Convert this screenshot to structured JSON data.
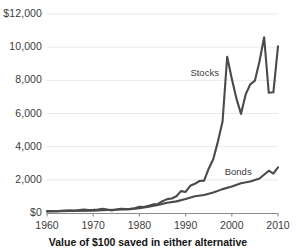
{
  "chart_data": {
    "type": "line",
    "title": "",
    "subtitle": "",
    "caption": "Value of $100 saved in either alternative",
    "xlabel": "",
    "ylabel": "",
    "xlim": [
      1960,
      2010
    ],
    "ylim": [
      0,
      12000
    ],
    "grid": true,
    "legend_position": "inline-annotation",
    "y_ticks": [
      0,
      2000,
      4000,
      6000,
      8000,
      10000,
      12000
    ],
    "y_tick_labels": [
      "$0",
      "2,000",
      "4,000",
      "6,000",
      "8,000",
      "10,000",
      "$12,000"
    ],
    "x_ticks": [
      1960,
      1970,
      1980,
      1990,
      2000,
      2010
    ],
    "x_tick_labels": [
      "1960",
      "1970",
      "1980",
      "1990",
      "2000",
      "2010"
    ],
    "annotations": [
      {
        "name": "stocks-label",
        "text": "Stocks",
        "x": 1994.5,
        "y": 8450
      },
      {
        "name": "bonds-label",
        "text": "Bonds",
        "x": 2001.5,
        "y": 2500
      }
    ],
    "series": [
      {
        "name": "Stocks",
        "color": "#4a4a4a",
        "x": [
          1960,
          1961,
          1962,
          1963,
          1964,
          1965,
          1966,
          1967,
          1968,
          1969,
          1970,
          1971,
          1972,
          1973,
          1974,
          1975,
          1976,
          1977,
          1978,
          1979,
          1980,
          1981,
          1982,
          1983,
          1984,
          1985,
          1986,
          1987,
          1988,
          1989,
          1990,
          1991,
          1992,
          1993,
          1994,
          1995,
          1996,
          1997,
          1998,
          1999,
          2000,
          2001,
          2002,
          2003,
          2004,
          2005,
          2006,
          2007,
          2008,
          2009,
          2010
        ],
        "values": [
          100,
          118,
          108,
          131,
          151,
          168,
          150,
          184,
          201,
          183,
          188,
          213,
          250,
          212,
          154,
          208,
          255,
          235,
          248,
          291,
          380,
          358,
          430,
          520,
          547,
          713,
          838,
          875,
          1010,
          1320,
          1270,
          1640,
          1760,
          1930,
          1950,
          2670,
          3260,
          4320,
          5520,
          6650,
          6050,
          5300,
          4120,
          5280,
          5840,
          6100,
          7040,
          7400,
          4650,
          5880,
          6740
        ],
        "values_scaled": [
          100,
          118,
          108,
          131,
          151,
          168,
          150,
          184,
          201,
          183,
          188,
          213,
          250,
          212,
          154,
          208,
          255,
          235,
          248,
          291,
          380,
          358,
          430,
          520,
          547,
          713,
          838,
          875,
          1010,
          1320,
          1270,
          1640,
          1760,
          1930,
          1950,
          2670,
          3260,
          4320,
          5520,
          9420,
          8100,
          6900,
          5980,
          7150,
          7760,
          7980,
          9150,
          10600,
          7250,
          7280,
          10050
        ]
      },
      {
        "name": "Bonds",
        "color": "#4a4a4a",
        "x": [
          1960,
          1965,
          1970,
          1972,
          1975,
          1978,
          1980,
          1982,
          1984,
          1986,
          1988,
          1990,
          1992,
          1994,
          1996,
          1998,
          2000,
          2002,
          2004,
          2006,
          2008,
          2009,
          2010
        ],
        "values": [
          100,
          120,
          145,
          175,
          200,
          235,
          290,
          380,
          480,
          620,
          700,
          840,
          1010,
          1090,
          1240,
          1440,
          1600,
          1790,
          1900,
          2080,
          2550,
          2380,
          2750
        ]
      }
    ]
  },
  "yaxis": {
    "labels": [
      "$12,000",
      "10,000",
      "8,000",
      "6,000",
      "4,000",
      "2,000",
      "$0"
    ]
  },
  "xaxis": {
    "labels": [
      "1960",
      "1970",
      "1980",
      "1990",
      "2000",
      "2010"
    ]
  },
  "colors": {
    "line": "#4a4a4a",
    "grid": "#e9e9e9",
    "axis": "#8c8c8c",
    "text": "#3b3b3b",
    "caption": "#141414",
    "background": "#ffffff"
  }
}
